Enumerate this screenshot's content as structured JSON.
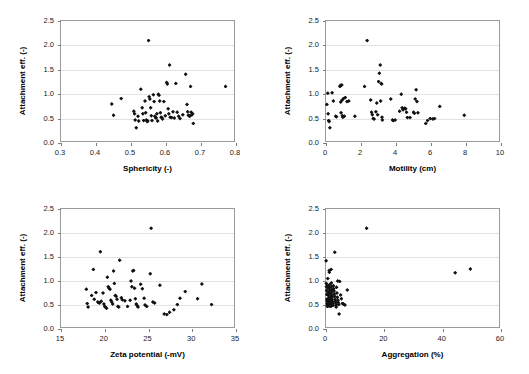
{
  "figure": {
    "title": "",
    "background": "#ffffff",
    "marker_color": "#111111",
    "grid_color": "#e2e2e2",
    "frame_color": "#9a9a9a"
  },
  "chart_data": [
    {
      "type": "scatter",
      "id": "sphericity",
      "title": "",
      "xlabel": "Sphericity (-)",
      "ylabel": "Attachment eff. (-)",
      "xlim": [
        0.3,
        0.8
      ],
      "ylim": [
        0.0,
        2.5
      ],
      "xticks": [
        "0.3",
        "0.4",
        "0.5",
        "0.6",
        "0.7",
        "0.8"
      ],
      "xtick_values": [
        0.3,
        0.4,
        0.5,
        0.6,
        0.7,
        0.8
      ],
      "yticks": [
        "0.0",
        "0.5",
        "1.0",
        "1.5",
        "2.0",
        "2.5"
      ],
      "ytick_values": [
        0.0,
        0.5,
        1.0,
        1.5,
        2.0,
        2.5
      ],
      "grid": "horizontal",
      "legend": "none",
      "points": [
        [
          0.445,
          0.8
        ],
        [
          0.45,
          0.57
        ],
        [
          0.472,
          0.91
        ],
        [
          0.508,
          0.65
        ],
        [
          0.51,
          0.6
        ],
        [
          0.512,
          0.47
        ],
        [
          0.515,
          0.31
        ],
        [
          0.52,
          0.55
        ],
        [
          0.522,
          0.45
        ],
        [
          0.528,
          1.1
        ],
        [
          0.532,
          0.72
        ],
        [
          0.534,
          0.6
        ],
        [
          0.536,
          0.46
        ],
        [
          0.54,
          0.86
        ],
        [
          0.542,
          0.62
        ],
        [
          0.544,
          0.47
        ],
        [
          0.546,
          0.44
        ],
        [
          0.548,
          0.45
        ],
        [
          0.55,
          2.1
        ],
        [
          0.552,
          0.95
        ],
        [
          0.554,
          0.9
        ],
        [
          0.556,
          0.72
        ],
        [
          0.558,
          0.56
        ],
        [
          0.56,
          0.46
        ],
        [
          0.564,
          0.99
        ],
        [
          0.566,
          0.85
        ],
        [
          0.568,
          0.55
        ],
        [
          0.57,
          0.52
        ],
        [
          0.572,
          0.51
        ],
        [
          0.574,
          0.6
        ],
        [
          0.576,
          0.45
        ],
        [
          0.578,
          1.0
        ],
        [
          0.58,
          0.98
        ],
        [
          0.582,
          0.86
        ],
        [
          0.584,
          0.62
        ],
        [
          0.586,
          0.53
        ],
        [
          0.588,
          0.52
        ],
        [
          0.59,
          0.49
        ],
        [
          0.594,
          0.85
        ],
        [
          0.598,
          0.56
        ],
        [
          0.602,
          1.24
        ],
        [
          0.604,
          1.21
        ],
        [
          0.606,
          0.7
        ],
        [
          0.608,
          0.6
        ],
        [
          0.61,
          1.6
        ],
        [
          0.612,
          0.53
        ],
        [
          0.616,
          0.52
        ],
        [
          0.62,
          0.64
        ],
        [
          0.624,
          0.51
        ],
        [
          0.628,
          1.22
        ],
        [
          0.632,
          0.63
        ],
        [
          0.636,
          0.55
        ],
        [
          0.64,
          0.5
        ],
        [
          0.648,
          0.58
        ],
        [
          0.656,
          1.41
        ],
        [
          0.66,
          0.79
        ],
        [
          0.662,
          0.64
        ],
        [
          0.664,
          0.57
        ],
        [
          0.666,
          0.56
        ],
        [
          0.668,
          0.55
        ],
        [
          0.67,
          1.16
        ],
        [
          0.672,
          0.63
        ],
        [
          0.674,
          0.58
        ],
        [
          0.676,
          0.6
        ],
        [
          0.678,
          0.4
        ],
        [
          0.77,
          1.16
        ]
      ]
    },
    {
      "type": "scatter",
      "id": "motility",
      "title": "",
      "xlabel": "Motility (cm)",
      "ylabel": "Attachment eff. (-)",
      "xlim": [
        0,
        10
      ],
      "ylim": [
        0.0,
        2.5
      ],
      "xticks": [
        "0",
        "2",
        "4",
        "6",
        "8",
        "10"
      ],
      "xtick_values": [
        0,
        2,
        4,
        6,
        8,
        10
      ],
      "yticks": [
        "0.0",
        "0.5",
        "1.0",
        "1.5",
        "2.0",
        "2.5"
      ],
      "ytick_values": [
        0.0,
        0.5,
        1.0,
        1.5,
        2.0,
        2.5
      ],
      "grid": "horizontal",
      "legend": "none",
      "points": [
        [
          0.05,
          0.79
        ],
        [
          0.1,
          1.02
        ],
        [
          0.12,
          0.6
        ],
        [
          0.15,
          0.46
        ],
        [
          0.18,
          0.44
        ],
        [
          0.22,
          0.31
        ],
        [
          0.35,
          1.03
        ],
        [
          0.42,
          0.86
        ],
        [
          0.55,
          0.55
        ],
        [
          0.6,
          0.54
        ],
        [
          0.8,
          1.16
        ],
        [
          0.82,
          1.18
        ],
        [
          0.84,
          0.84
        ],
        [
          0.86,
          0.62
        ],
        [
          0.9,
          1.19
        ],
        [
          0.92,
          0.88
        ],
        [
          0.94,
          0.56
        ],
        [
          0.96,
          0.53
        ],
        [
          1.0,
          0.91
        ],
        [
          1.05,
          0.55
        ],
        [
          1.1,
          0.93
        ],
        [
          1.2,
          0.85
        ],
        [
          1.3,
          0.86
        ],
        [
          1.65,
          0.55
        ],
        [
          2.2,
          1.16
        ],
        [
          2.35,
          2.1
        ],
        [
          2.55,
          0.88
        ],
        [
          2.6,
          0.63
        ],
        [
          2.65,
          0.58
        ],
        [
          2.7,
          0.5
        ],
        [
          2.75,
          0.49
        ],
        [
          2.85,
          0.64
        ],
        [
          2.9,
          0.82
        ],
        [
          2.95,
          0.58
        ],
        [
          3.0,
          1.26
        ],
        [
          3.05,
          1.43
        ],
        [
          3.1,
          1.6
        ],
        [
          3.12,
          0.86
        ],
        [
          3.15,
          1.22
        ],
        [
          3.18,
          1.21
        ],
        [
          3.2,
          0.53
        ],
        [
          3.22,
          0.47
        ],
        [
          3.7,
          0.9
        ],
        [
          3.8,
          0.47
        ],
        [
          3.85,
          0.46
        ],
        [
          3.95,
          0.47
        ],
        [
          4.2,
          0.65
        ],
        [
          4.3,
          1.0
        ],
        [
          4.35,
          0.72
        ],
        [
          4.4,
          0.68
        ],
        [
          4.5,
          0.71
        ],
        [
          4.55,
          0.7
        ],
        [
          4.6,
          0.63
        ],
        [
          4.65,
          0.52
        ],
        [
          4.8,
          0.52
        ],
        [
          5.0,
          0.63
        ],
        [
          5.05,
          0.61
        ],
        [
          5.1,
          0.9
        ],
        [
          5.15,
          1.09
        ],
        [
          5.2,
          0.85
        ],
        [
          5.25,
          0.62
        ],
        [
          5.7,
          0.4
        ],
        [
          5.8,
          0.46
        ],
        [
          5.95,
          0.5
        ],
        [
          6.1,
          0.49
        ],
        [
          6.2,
          0.5
        ],
        [
          6.5,
          0.75
        ],
        [
          7.9,
          0.57
        ]
      ]
    },
    {
      "type": "scatter",
      "id": "zeta-potential",
      "title": "",
      "xlabel": "Zeta potential (-mV)",
      "ylabel": "Attachment eff. (-)",
      "xlim": [
        15,
        35
      ],
      "ylim": [
        0.0,
        2.5
      ],
      "xticks": [
        "15",
        "20",
        "25",
        "30",
        "35"
      ],
      "xtick_values": [
        15,
        20,
        25,
        30,
        35
      ],
      "yticks": [
        "0.0",
        "0.5",
        "1.0",
        "1.5",
        "2.0",
        "2.5"
      ],
      "ytick_values": [
        0.0,
        0.5,
        1.0,
        1.5,
        2.0,
        2.5
      ],
      "grid": "horizontal",
      "legend": "none",
      "points": [
        [
          17.9,
          0.83
        ],
        [
          18.0,
          0.53
        ],
        [
          18.1,
          0.46
        ],
        [
          18.5,
          0.7
        ],
        [
          18.7,
          1.24
        ],
        [
          18.8,
          0.62
        ],
        [
          19.0,
          0.76
        ],
        [
          19.2,
          0.56
        ],
        [
          19.3,
          0.55
        ],
        [
          19.4,
          0.54
        ],
        [
          19.5,
          1.61
        ],
        [
          19.6,
          0.58
        ],
        [
          19.8,
          0.75
        ],
        [
          19.9,
          0.52
        ],
        [
          20.0,
          0.47
        ],
        [
          20.1,
          0.45
        ],
        [
          20.2,
          0.43
        ],
        [
          20.3,
          1.08
        ],
        [
          20.4,
          0.88
        ],
        [
          20.5,
          0.85
        ],
        [
          20.6,
          0.83
        ],
        [
          20.7,
          0.6
        ],
        [
          20.8,
          0.56
        ],
        [
          20.9,
          0.52
        ],
        [
          21.0,
          1.21
        ],
        [
          21.1,
          0.95
        ],
        [
          21.2,
          0.7
        ],
        [
          21.3,
          0.68
        ],
        [
          21.4,
          0.62
        ],
        [
          21.5,
          0.47
        ],
        [
          21.6,
          0.46
        ],
        [
          21.7,
          1.43
        ],
        [
          21.9,
          0.65
        ],
        [
          22.0,
          0.61
        ],
        [
          22.3,
          0.59
        ],
        [
          22.6,
          0.47
        ],
        [
          22.9,
          0.6
        ],
        [
          23.0,
          1.0
        ],
        [
          23.1,
          0.88
        ],
        [
          23.2,
          1.21
        ],
        [
          23.3,
          1.22
        ],
        [
          23.4,
          0.85
        ],
        [
          23.5,
          0.63
        ],
        [
          23.6,
          0.52
        ],
        [
          23.7,
          0.49
        ],
        [
          23.8,
          0.46
        ],
        [
          24.1,
          0.93
        ],
        [
          24.3,
          0.84
        ],
        [
          24.5,
          0.64
        ],
        [
          24.6,
          0.5
        ],
        [
          24.8,
          0.47
        ],
        [
          25.2,
          1.15
        ],
        [
          25.3,
          2.1
        ],
        [
          25.5,
          0.56
        ],
        [
          25.7,
          0.54
        ],
        [
          26.3,
          0.91
        ],
        [
          26.8,
          0.31
        ],
        [
          27.1,
          0.3
        ],
        [
          27.4,
          0.35
        ],
        [
          27.9,
          0.4
        ],
        [
          28.3,
          0.51
        ],
        [
          28.6,
          0.64
        ],
        [
          29.2,
          0.78
        ],
        [
          30.6,
          0.63
        ],
        [
          31.1,
          0.94
        ],
        [
          32.2,
          0.51
        ]
      ]
    },
    {
      "type": "scatter",
      "id": "aggregation",
      "title": "",
      "xlabel": "Aggregation (%)",
      "ylabel": "Attachment eff. (-)",
      "xlim": [
        0,
        60
      ],
      "ylim": [
        0.0,
        2.5
      ],
      "xticks": [
        "0",
        "20",
        "40",
        "60"
      ],
      "xtick_values": [
        0,
        20,
        40,
        60
      ],
      "yticks": [
        "0.0",
        "0.5",
        "1.0",
        "1.5",
        "2.0",
        "2.5"
      ],
      "ytick_values": [
        0.0,
        0.5,
        1.0,
        1.5,
        2.0,
        2.5
      ],
      "grid": "horizontal",
      "legend": "none",
      "points": [
        [
          0.05,
          1.42
        ],
        [
          0.1,
          0.95
        ],
        [
          0.15,
          0.88
        ],
        [
          0.2,
          0.8
        ],
        [
          0.25,
          0.72
        ],
        [
          0.3,
          0.62
        ],
        [
          0.35,
          0.58
        ],
        [
          0.4,
          0.53
        ],
        [
          0.45,
          0.5
        ],
        [
          0.5,
          0.47
        ],
        [
          0.6,
          1.05
        ],
        [
          0.65,
          0.9
        ],
        [
          0.7,
          0.85
        ],
        [
          0.75,
          0.76
        ],
        [
          0.8,
          0.7
        ],
        [
          0.85,
          0.64
        ],
        [
          0.9,
          0.6
        ],
        [
          0.95,
          0.56
        ],
        [
          1.0,
          0.52
        ],
        [
          1.05,
          0.48
        ],
        [
          1.1,
          1.22
        ],
        [
          1.15,
          1.18
        ],
        [
          1.2,
          0.92
        ],
        [
          1.25,
          0.86
        ],
        [
          1.3,
          0.8
        ],
        [
          1.35,
          0.74
        ],
        [
          1.4,
          0.68
        ],
        [
          1.45,
          0.63
        ],
        [
          1.5,
          0.59
        ],
        [
          1.55,
          0.55
        ],
        [
          1.6,
          0.51
        ],
        [
          1.65,
          0.47
        ],
        [
          1.75,
          1.24
        ],
        [
          1.85,
          0.96
        ],
        [
          1.9,
          0.88
        ],
        [
          1.95,
          0.82
        ],
        [
          2.0,
          0.77
        ],
        [
          2.05,
          0.71
        ],
        [
          2.1,
          0.66
        ],
        [
          2.15,
          0.61
        ],
        [
          2.2,
          0.57
        ],
        [
          2.3,
          0.53
        ],
        [
          2.4,
          0.49
        ],
        [
          2.55,
          0.9
        ],
        [
          2.65,
          0.84
        ],
        [
          2.75,
          0.79
        ],
        [
          2.85,
          0.73
        ],
        [
          2.95,
          0.68
        ],
        [
          3.0,
          1.6
        ],
        [
          3.1,
          0.62
        ],
        [
          3.2,
          0.58
        ],
        [
          3.3,
          0.54
        ],
        [
          3.4,
          0.5
        ],
        [
          3.5,
          0.46
        ],
        [
          3.6,
          0.87
        ],
        [
          3.75,
          0.75
        ],
        [
          3.9,
          0.66
        ],
        [
          4.0,
          1.0
        ],
        [
          4.1,
          0.6
        ],
        [
          4.2,
          0.55
        ],
        [
          4.35,
          0.51
        ],
        [
          4.5,
          0.31
        ],
        [
          4.7,
          0.99
        ],
        [
          5.0,
          0.71
        ],
        [
          5.3,
          0.63
        ],
        [
          5.6,
          0.53
        ],
        [
          6.0,
          0.52
        ],
        [
          6.5,
          0.5
        ],
        [
          7.3,
          0.81
        ],
        [
          13.9,
          2.1
        ],
        [
          44.3,
          1.17
        ],
        [
          49.5,
          1.25
        ]
      ]
    }
  ]
}
